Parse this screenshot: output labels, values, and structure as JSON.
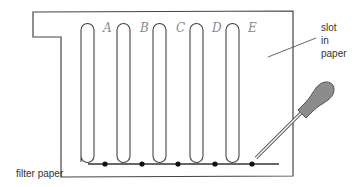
{
  "diagram": {
    "lanes": [
      {
        "letter": "A"
      },
      {
        "letter": "B"
      },
      {
        "letter": "C"
      },
      {
        "letter": "D"
      },
      {
        "letter": "E"
      }
    ],
    "labels": {
      "slot_line1": "slot",
      "slot_line2": "in",
      "slot_line3": "paper",
      "filter_paper": "filter paper"
    },
    "colors": {
      "outline": "#444444",
      "dropper_bulb": "#8c8c8c",
      "spot": "#111111",
      "letters": "#8a8a8a"
    }
  }
}
